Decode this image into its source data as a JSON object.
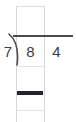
{
  "worksheet": {
    "type": "long-division",
    "problem": {
      "divisor": "7",
      "dividend": "84",
      "dividend_digits": [
        "8",
        "4"
      ],
      "quotient": "",
      "expression": "7)84"
    },
    "labels": {
      "quotient_box": "",
      "work_row_one": "",
      "work_row_two": ""
    },
    "marks": {
      "division_bracket": "division-bracket",
      "vinculum": "division-bar",
      "subtraction_rule": "subtraction-line"
    },
    "colors": {
      "ink": "#3c3c40",
      "rule_dark": "#24242a",
      "rule_medium": "#4a4a4f",
      "grid_light": "#d8d8d8",
      "background": "#ffffff"
    }
  }
}
